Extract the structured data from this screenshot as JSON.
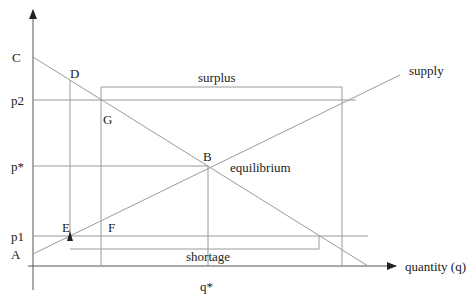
{
  "diagram": {
    "type": "supply-demand",
    "axes": {
      "x_label": "quantity (q)",
      "y_label": ""
    },
    "price_labels": {
      "c": "C",
      "p2": "p2",
      "p_star": "p*",
      "p1": "p1",
      "a": "A"
    },
    "quantity_labels": {
      "q_star": "q*"
    },
    "points": {
      "d": "D",
      "g": "G",
      "b": "B",
      "e": "E",
      "f": "F"
    },
    "curve_labels": {
      "supply": "supply"
    },
    "annotations": {
      "equilibrium": "equilibrium",
      "surplus": "surplus",
      "shortage": "shortage"
    },
    "colors": {
      "line": "#9a9a9a",
      "axis": "#555555",
      "text": "#222222"
    }
  }
}
